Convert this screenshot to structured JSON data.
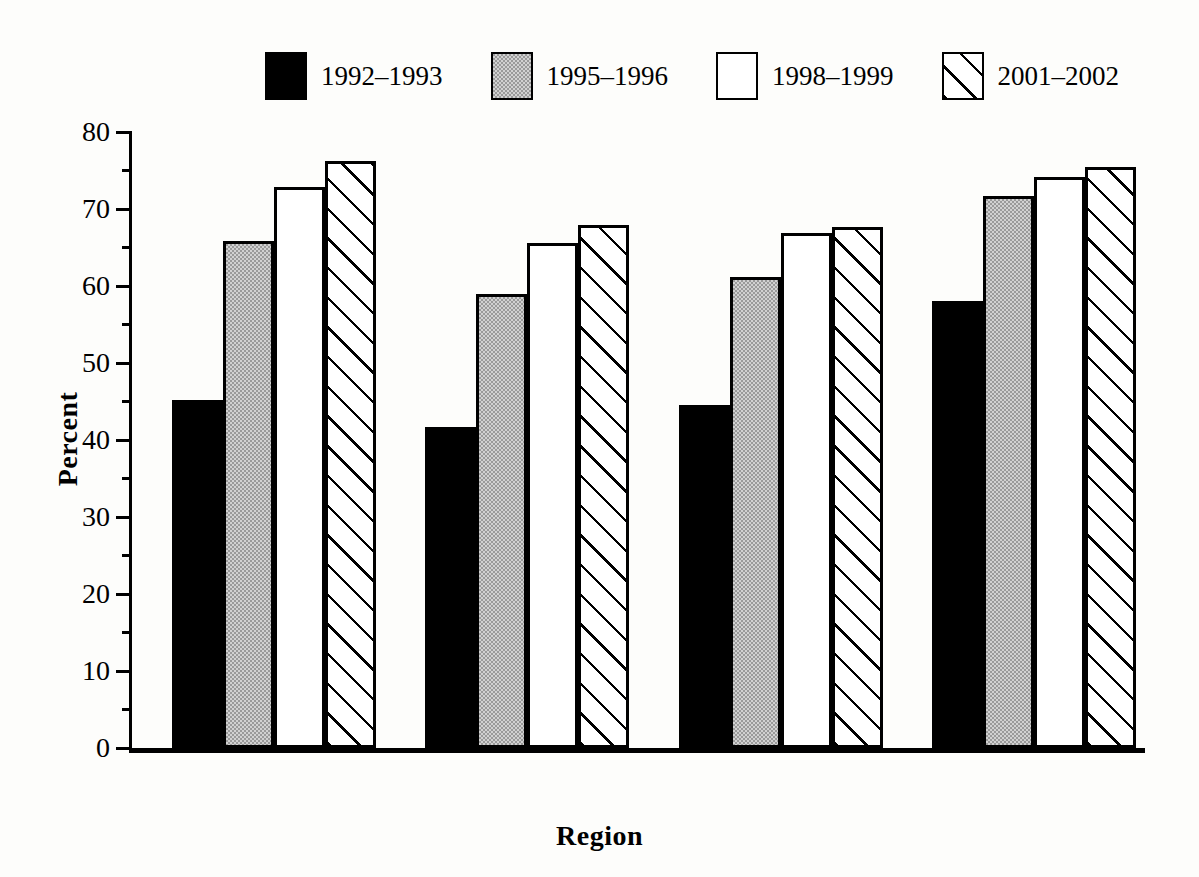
{
  "chart_data": {
    "type": "bar",
    "title": "",
    "xlabel": "Region",
    "ylabel": "Percent",
    "ylim": [
      0,
      80
    ],
    "ytick_step": 10,
    "yminor_step": 5,
    "grid": false,
    "legend_position": "top",
    "categories": [
      "Northeast",
      "Midwest",
      "South",
      "West"
    ],
    "yticks": [
      "0",
      "10",
      "20",
      "30",
      "40",
      "50",
      "60",
      "70",
      "80"
    ],
    "series": [
      {
        "name": "1992–1993",
        "fill": "solid-black",
        "values": [
          45.2,
          41.7,
          44.5,
          58.1
        ]
      },
      {
        "name": "1995–1996",
        "fill": "gray",
        "values": [
          65.9,
          59.0,
          61.2,
          71.7
        ]
      },
      {
        "name": "1998–1999",
        "fill": "white",
        "values": [
          72.8,
          65.6,
          66.9,
          74.1
        ]
      },
      {
        "name": "2001–2002",
        "fill": "hatch",
        "values": [
          76.3,
          67.9,
          67.6,
          75.5
        ]
      }
    ]
  },
  "colors": {
    "axis": "#000000",
    "series_black": "#000000",
    "series_gray": "#9a9a9a",
    "series_white": "#ffffff",
    "series_hatch_line": "#000000",
    "background": "#fdfdfb"
  }
}
